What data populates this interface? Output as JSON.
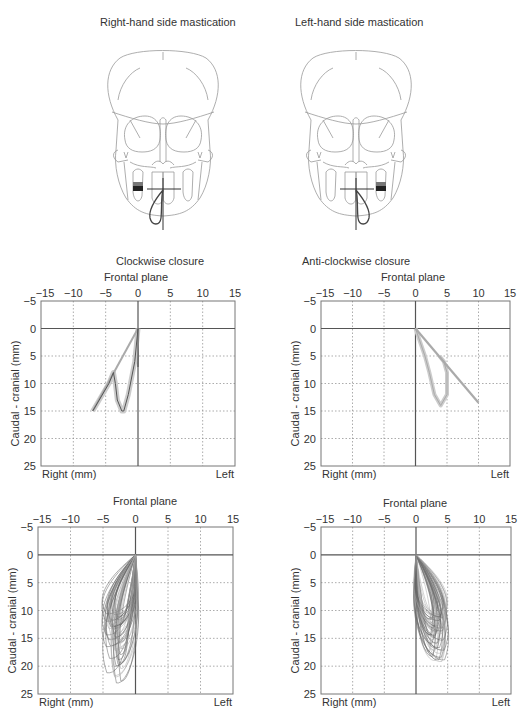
{
  "header": {
    "left_title": "Right-hand side mastication",
    "right_title": "Left-hand side mastication"
  },
  "section_labels": {
    "left": "Clockwise closure",
    "right": "Anti-clockwise closure"
  },
  "caption_fragment": "",
  "axis": {
    "x_ticks": [
      "−15",
      "−10",
      "−5",
      "0",
      "5",
      "10",
      "15"
    ],
    "x_tick_values": [
      -15,
      -10,
      -5,
      0,
      5,
      10,
      15
    ],
    "y_ticks": [
      "−5",
      "0",
      "5",
      "10",
      "15",
      "20",
      "25"
    ],
    "y_tick_values": [
      -5,
      0,
      5,
      10,
      15,
      20,
      25
    ],
    "ylabel": "Caudal - cranial (mm)",
    "xlabel_left": "Right (mm)",
    "xlabel_right": "Left",
    "plane_title": "Frontal plane"
  },
  "colors": {
    "axis": "#555555",
    "grid": "#888888",
    "trace_dark": "#555555",
    "trace_light": "#aaaaaa",
    "band": "#cccccc",
    "skull": "#999999",
    "chew_dark": "#222222"
  },
  "chart_data": [
    {
      "type": "line",
      "title": "Frontal plane",
      "subtitle": "Clockwise closure (right-hand side mastication, mean trace)",
      "xlabel": "Right (mm) — Left",
      "ylabel": "Caudal - cranial (mm)",
      "xlim": [
        -15,
        15
      ],
      "ylim": [
        -5,
        25
      ],
      "y_inverted": true,
      "grid": true,
      "series": [
        {
          "name": "opening path (straight)",
          "x": [
            0,
            -7
          ],
          "y": [
            0,
            15
          ]
        },
        {
          "name": "closing loop (mean)",
          "x": [
            -7,
            -4.5,
            -3.8,
            -3.5,
            -3.2,
            -2.5,
            -2.2,
            -1.5,
            -1,
            -0.5,
            0
          ],
          "y": [
            15,
            10,
            8,
            10,
            13,
            15,
            15,
            12,
            9,
            6,
            0
          ]
        },
        {
          "name": "vertical reference",
          "x": [
            0,
            0
          ],
          "y": [
            0,
            7
          ]
        }
      ]
    },
    {
      "type": "line",
      "title": "Frontal plane",
      "subtitle": "Anti-clockwise closure (left-hand side mastication, mean trace)",
      "xlabel": "Right (mm) — Left",
      "ylabel": "Caudal - cranial (mm)",
      "xlim": [
        -15,
        15
      ],
      "ylim": [
        -5,
        25
      ],
      "y_inverted": true,
      "grid": true,
      "series": [
        {
          "name": "opening path (straight)",
          "x": [
            0,
            10
          ],
          "y": [
            0,
            13.5
          ]
        },
        {
          "name": "closing loop (mean)",
          "x": [
            0,
            1.5,
            2.2,
            3,
            4,
            5,
            5,
            4.5,
            3.8
          ],
          "y": [
            0,
            5,
            8,
            12,
            14,
            12,
            8,
            6,
            5
          ]
        }
      ]
    },
    {
      "type": "line",
      "title": "Frontal plane",
      "subtitle": "Clockwise closure (individual cycles)",
      "xlabel": "Right (mm) — Left",
      "ylabel": "Caudal - cranial (mm)",
      "xlim": [
        -15,
        15
      ],
      "ylim": [
        -5,
        25
      ],
      "y_inverted": true,
      "grid": true,
      "series": [
        {
          "name": "cycle envelope",
          "x_range": [
            -6.5,
            2
          ],
          "y_range": [
            0,
            23.5
          ]
        }
      ]
    },
    {
      "type": "line",
      "title": "Frontal plane",
      "subtitle": "Anti-clockwise closure (individual cycles)",
      "xlabel": "Right (mm) — Left",
      "ylabel": "Caudal - cranial (mm)",
      "xlim": [
        -15,
        15
      ],
      "ylim": [
        -5,
        25
      ],
      "y_inverted": true,
      "grid": true,
      "series": [
        {
          "name": "cycle envelope",
          "x_range": [
            -1.5,
            6.5
          ],
          "y_range": [
            0,
            19.5
          ]
        }
      ]
    }
  ]
}
